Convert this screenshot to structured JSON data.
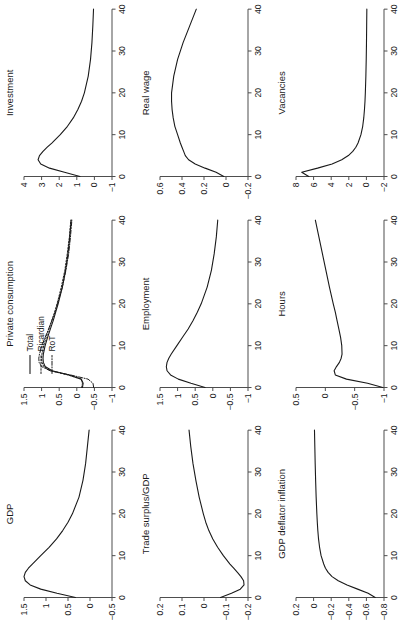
{
  "figure": {
    "rotation_degrees": -90,
    "grid_rows": 3,
    "grid_cols": 3,
    "background_color": "#ffffff",
    "line_color": "#1a1a1a",
    "axis_color": "#4d4d4d"
  },
  "legend": {
    "position": "top-left of Private consumption panel",
    "entries": [
      {
        "label": "Total",
        "style": "solid"
      },
      {
        "label": "Ricardian",
        "style": "dashed"
      },
      {
        "label": "RoT",
        "style": "dashdot"
      }
    ]
  },
  "chart_data": [
    {
      "type": "line",
      "title": "GDP",
      "xlabel": "",
      "ylabel": "",
      "xlim": [
        0,
        40
      ],
      "ylim": [
        -0.5,
        1.5
      ],
      "xticks": [
        0,
        10,
        20,
        30,
        40
      ],
      "yticks": [
        -0.5,
        0,
        0.5,
        1,
        1.5
      ],
      "grid": false,
      "x": [
        0,
        1,
        2,
        3,
        4,
        5,
        6,
        7,
        8,
        10,
        12,
        14,
        16,
        18,
        20,
        24,
        28,
        32,
        36,
        40
      ],
      "series": [
        {
          "name": "GDP",
          "style": "solid",
          "values": [
            0.33,
            0.75,
            1.12,
            1.36,
            1.47,
            1.5,
            1.47,
            1.4,
            1.31,
            1.12,
            0.93,
            0.76,
            0.62,
            0.5,
            0.4,
            0.25,
            0.16,
            0.1,
            0.06,
            0.02
          ]
        }
      ]
    },
    {
      "type": "line",
      "title": "Private consumption",
      "xlabel": "",
      "ylabel": "",
      "xlim": [
        0,
        40
      ],
      "ylim": [
        -1,
        1.5
      ],
      "xticks": [
        0,
        10,
        20,
        30,
        40
      ],
      "yticks": [
        -1,
        -0.5,
        0,
        0.5,
        1,
        1.5
      ],
      "grid": false,
      "x": [
        0,
        1,
        2,
        3,
        4,
        5,
        6,
        7,
        8,
        10,
        12,
        14,
        16,
        18,
        20,
        24,
        28,
        32,
        36,
        40
      ],
      "series": [
        {
          "name": "Total",
          "style": "solid",
          "values": [
            -0.16,
            -0.18,
            -0.13,
            0.22,
            0.7,
            0.9,
            0.95,
            0.96,
            0.95,
            0.9,
            0.83,
            0.75,
            0.67,
            0.6,
            0.53,
            0.41,
            0.32,
            0.25,
            0.2,
            0.16
          ]
        },
        {
          "name": "Ricardian",
          "style": "dashed",
          "values": [
            -0.14,
            -0.16,
            -0.12,
            0.25,
            0.74,
            0.94,
            0.99,
            1.0,
            0.99,
            0.94,
            0.87,
            0.79,
            0.71,
            0.63,
            0.56,
            0.44,
            0.34,
            0.27,
            0.21,
            0.17
          ]
        },
        {
          "name": "RoT",
          "style": "dashdot",
          "values": [
            -0.48,
            -0.46,
            -0.32,
            0.18,
            0.76,
            1.0,
            1.07,
            1.08,
            1.06,
            0.99,
            0.9,
            0.8,
            0.71,
            0.62,
            0.55,
            0.41,
            0.31,
            0.23,
            0.18,
            0.14
          ]
        }
      ]
    },
    {
      "type": "line",
      "title": "Investment",
      "xlabel": "",
      "ylabel": "",
      "xlim": [
        0,
        40
      ],
      "ylim": [
        -1,
        4
      ],
      "xticks": [
        0,
        10,
        20,
        30,
        40
      ],
      "yticks": [
        -1,
        0,
        1,
        2,
        3,
        4
      ],
      "grid": false,
      "x": [
        0,
        1,
        2,
        3,
        4,
        5,
        6,
        7,
        8,
        10,
        12,
        14,
        16,
        18,
        20,
        24,
        28,
        32,
        36,
        40
      ],
      "series": [
        {
          "name": "Investment",
          "style": "solid",
          "values": [
            0.82,
            1.7,
            2.55,
            3.05,
            3.2,
            3.12,
            2.92,
            2.68,
            2.42,
            1.94,
            1.53,
            1.2,
            0.94,
            0.73,
            0.57,
            0.35,
            0.22,
            0.14,
            0.09,
            0.05
          ]
        }
      ]
    },
    {
      "type": "line",
      "title": "Trade surplus/GDP",
      "xlabel": "",
      "ylabel": "",
      "xlim": [
        0,
        40
      ],
      "ylim": [
        -0.2,
        0.2
      ],
      "xticks": [
        0,
        10,
        20,
        30,
        40
      ],
      "yticks": [
        -0.2,
        -0.1,
        0,
        0.1,
        0.2
      ],
      "grid": false,
      "x": [
        0,
        1,
        2,
        3,
        4,
        5,
        6,
        7,
        8,
        10,
        12,
        14,
        16,
        18,
        20,
        24,
        28,
        32,
        36,
        40
      ],
      "series": [
        {
          "name": "Trade surplus/GDP",
          "style": "solid",
          "values": [
            -0.075,
            -0.125,
            -0.165,
            -0.182,
            -0.18,
            -0.168,
            -0.152,
            -0.135,
            -0.118,
            -0.088,
            -0.062,
            -0.04,
            -0.022,
            -0.008,
            0.003,
            0.022,
            0.037,
            0.05,
            0.06,
            0.068
          ]
        }
      ]
    },
    {
      "type": "line",
      "title": "Employment",
      "xlabel": "",
      "ylabel": "",
      "xlim": [
        0,
        40
      ],
      "ylim": [
        -1,
        1.5
      ],
      "xticks": [
        0,
        10,
        20,
        30,
        40
      ],
      "yticks": [
        -1,
        -0.5,
        0,
        0.5,
        1,
        1.5
      ],
      "grid": false,
      "x": [
        0,
        1,
        2,
        3,
        4,
        5,
        6,
        7,
        8,
        10,
        12,
        14,
        16,
        18,
        20,
        24,
        28,
        32,
        36,
        40
      ],
      "series": [
        {
          "name": "Employment",
          "style": "solid",
          "values": [
            0.22,
            0.62,
            0.98,
            1.2,
            1.3,
            1.32,
            1.3,
            1.25,
            1.18,
            1.02,
            0.86,
            0.7,
            0.56,
            0.44,
            0.33,
            0.16,
            0.04,
            -0.04,
            -0.1,
            -0.14
          ]
        }
      ]
    },
    {
      "type": "line",
      "title": "Real wage",
      "xlabel": "",
      "ylabel": "",
      "xlim": [
        0,
        40
      ],
      "ylim": [
        -0.2,
        0.6
      ],
      "xticks": [
        0,
        10,
        20,
        30,
        40
      ],
      "yticks": [
        -0.2,
        0,
        0.2,
        0.4,
        0.6
      ],
      "grid": false,
      "x": [
        0,
        1,
        2,
        3,
        4,
        5,
        6,
        7,
        8,
        10,
        12,
        14,
        16,
        18,
        20,
        24,
        28,
        32,
        36,
        40
      ],
      "series": [
        {
          "name": "Real wage",
          "style": "solid",
          "values": [
            0.02,
            0.09,
            0.19,
            0.28,
            0.34,
            0.37,
            0.385,
            0.4,
            0.415,
            0.44,
            0.465,
            0.48,
            0.49,
            0.495,
            0.495,
            0.475,
            0.44,
            0.39,
            0.33,
            0.27
          ]
        }
      ]
    },
    {
      "type": "line",
      "title": "GDP deflator inflation",
      "xlabel": "",
      "ylabel": "",
      "xlim": [
        0,
        40
      ],
      "ylim": [
        -0.8,
        0.2
      ],
      "xticks": [
        0,
        10,
        20,
        30,
        40
      ],
      "yticks": [
        -0.8,
        -0.6,
        -0.4,
        -0.2,
        0,
        0.2
      ],
      "grid": false,
      "x": [
        0,
        1,
        2,
        3,
        4,
        5,
        6,
        7,
        8,
        10,
        12,
        14,
        16,
        18,
        20,
        24,
        28,
        32,
        36,
        40
      ],
      "series": [
        {
          "name": "GDP deflator inflation",
          "style": "solid",
          "values": [
            -0.7,
            -0.62,
            -0.5,
            -0.38,
            -0.28,
            -0.21,
            -0.165,
            -0.135,
            -0.115,
            -0.085,
            -0.068,
            -0.056,
            -0.048,
            -0.042,
            -0.037,
            -0.029,
            -0.023,
            -0.018,
            -0.014,
            -0.01
          ]
        }
      ]
    },
    {
      "type": "line",
      "title": "Hours",
      "xlabel": "",
      "ylabel": "",
      "xlim": [
        0,
        40
      ],
      "ylim": [
        -1,
        0.5
      ],
      "xticks": [
        0,
        10,
        20,
        30,
        40
      ],
      "yticks": [
        -1,
        -0.5,
        0,
        0.5
      ],
      "grid": false,
      "x": [
        0,
        1,
        2,
        3,
        4,
        5,
        6,
        7,
        8,
        10,
        12,
        14,
        16,
        18,
        20,
        24,
        28,
        32,
        36,
        40
      ],
      "series": [
        {
          "name": "Hours",
          "style": "solid",
          "values": [
            -0.98,
            -0.72,
            -0.36,
            -0.17,
            -0.15,
            -0.19,
            -0.24,
            -0.27,
            -0.285,
            -0.28,
            -0.26,
            -0.23,
            -0.2,
            -0.17,
            -0.135,
            -0.07,
            -0.01,
            0.05,
            0.11,
            0.17
          ]
        }
      ]
    },
    {
      "type": "line",
      "title": "Vacancies",
      "xlabel": "",
      "ylabel": "",
      "xlim": [
        0,
        40
      ],
      "ylim": [
        -2,
        8
      ],
      "xticks": [
        0,
        10,
        20,
        30,
        40
      ],
      "yticks": [
        -2,
        0,
        2,
        4,
        6,
        8
      ],
      "grid": false,
      "x": [
        0,
        1,
        2,
        3,
        4,
        5,
        6,
        7,
        8,
        10,
        12,
        14,
        16,
        18,
        20,
        24,
        28,
        32,
        36,
        40
      ],
      "series": [
        {
          "name": "Vacancies",
          "style": "solid",
          "values": [
            6.55,
            7.35,
            5.55,
            3.9,
            2.8,
            2.05,
            1.55,
            1.2,
            0.95,
            0.62,
            0.42,
            0.3,
            0.22,
            0.16,
            0.12,
            0.06,
            0.02,
            -0.01,
            -0.03,
            -0.05
          ]
        }
      ]
    }
  ]
}
